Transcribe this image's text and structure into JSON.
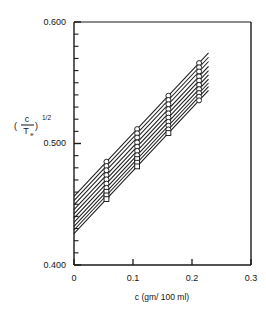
{
  "figure": {
    "name": "concentration-plot",
    "background": "#ffffff",
    "frame_color": "#1a1a1a",
    "line_color": "#1a1a1a",
    "marker_color": "#1a1a1a"
  },
  "axes": {
    "x": {
      "title": "c (gm/ 100 ml)",
      "tick_labels": [
        "0",
        "0.1",
        "0.2",
        "0.3"
      ],
      "tick_values": [
        0,
        0.1,
        0.2,
        0.3
      ],
      "min": 0,
      "max": 0.3,
      "minor_ticks": false
    },
    "y": {
      "title_numerator": "c",
      "title_denominator": "T",
      "title_denominator_sub": "e",
      "title_exponent": "1/2",
      "title_text": "(c/T e)^1/2",
      "tick_labels": [
        "0.400",
        "0.500",
        "0.600"
      ],
      "tick_values": [
        0.4,
        0.5,
        0.6
      ],
      "min": 0.4,
      "max": 0.6,
      "minor_tick_step": 0.01
    }
  },
  "chart_data": {
    "type": "line",
    "title": "",
    "xlabel": "c (gm/ 100 ml)",
    "ylabel": "(c/Te)^1/2",
    "xlim": [
      0,
      0.3
    ],
    "ylim": [
      0.4,
      0.6
    ],
    "grid": false,
    "legend": "none",
    "marker": "circle-and-square",
    "x": [
      0.0,
      0.055,
      0.107,
      0.16,
      0.212,
      0.228
    ],
    "series": [
      {
        "name": "line-1",
        "intercept": 0.4565,
        "slope": 0.5175,
        "values": [
          0.4565,
          0.485,
          0.5119,
          0.5393,
          0.5662,
          0.5745
        ]
      },
      {
        "name": "line-2",
        "intercept": 0.453,
        "slope": 0.5175,
        "values": [
          0.453,
          0.4815,
          0.5084,
          0.5358,
          0.5627,
          0.571
        ]
      },
      {
        "name": "line-3",
        "intercept": 0.4495,
        "slope": 0.5175,
        "values": [
          0.4495,
          0.478,
          0.5049,
          0.5323,
          0.5592,
          0.5675
        ]
      },
      {
        "name": "line-4",
        "intercept": 0.4455,
        "slope": 0.5175,
        "values": [
          0.4455,
          0.474,
          0.5009,
          0.5283,
          0.5552,
          0.5635
        ]
      },
      {
        "name": "line-5",
        "intercept": 0.442,
        "slope": 0.5175,
        "values": [
          0.442,
          0.4705,
          0.4974,
          0.5248,
          0.5517,
          0.56
        ]
      },
      {
        "name": "line-6",
        "intercept": 0.4385,
        "slope": 0.5175,
        "values": [
          0.4385,
          0.467,
          0.4939,
          0.5213,
          0.5482,
          0.5565
        ]
      },
      {
        "name": "line-7",
        "intercept": 0.435,
        "slope": 0.5175,
        "values": [
          0.435,
          0.4635,
          0.4904,
          0.5178,
          0.5447,
          0.553
        ]
      },
      {
        "name": "line-8",
        "intercept": 0.4318,
        "slope": 0.5175,
        "values": [
          0.4318,
          0.4603,
          0.4872,
          0.5146,
          0.5415,
          0.5498
        ]
      },
      {
        "name": "line-9",
        "intercept": 0.4288,
        "slope": 0.5175,
        "values": [
          0.4288,
          0.4573,
          0.4842,
          0.5116,
          0.5385,
          0.5468
        ]
      },
      {
        "name": "line-10",
        "intercept": 0.4258,
        "slope": 0.5175,
        "values": [
          0.4258,
          0.4543,
          0.4812,
          0.5086,
          0.5355,
          0.5438
        ]
      }
    ],
    "marker_x_columns": [
      0.055,
      0.107,
      0.16,
      0.212
    ]
  }
}
